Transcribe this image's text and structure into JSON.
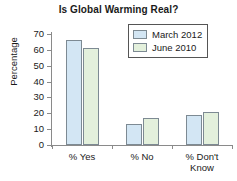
{
  "chart_data": {
    "type": "bar",
    "title": "Is Global Warming Real?",
    "xlabel": "",
    "ylabel": "Percentage",
    "categories": [
      "% Yes",
      "% No",
      "% Don't Know"
    ],
    "category_lines": [
      [
        "% Yes"
      ],
      [
        "% No"
      ],
      [
        "% Don't",
        "Know"
      ]
    ],
    "series": [
      {
        "name": "March 2012",
        "values": [
          66,
          13.5,
          19
        ],
        "color": "#d3e6f4"
      },
      {
        "name": "June 2010",
        "values": [
          61,
          17,
          21
        ],
        "color": "#e3f0dc"
      }
    ],
    "ylim": [
      0,
      70
    ],
    "yticks": [
      0,
      10,
      20,
      30,
      40,
      50,
      60,
      70
    ],
    "ytick_labels": [
      "0",
      "10",
      "20",
      "30",
      "40",
      "50",
      "60",
      "70"
    ],
    "grid": false,
    "legend_position": "top-right",
    "bar_edge_color": "#7d8a93",
    "axis_color": "#8a8a8a",
    "text_color": "#1a1a1a",
    "background": "#ffffff"
  }
}
